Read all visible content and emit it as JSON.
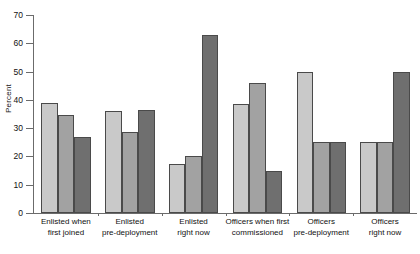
{
  "chart_data": {
    "type": "bar",
    "title": "",
    "subtitle": "",
    "xlabel": "",
    "ylabel": "Percent",
    "ylim": [
      0,
      70
    ],
    "ytick_values": [
      0,
      10,
      20,
      30,
      40,
      50,
      60,
      70
    ],
    "ytick_labels": [
      "0",
      "10",
      "20",
      "30",
      "40",
      "50",
      "60",
      "70"
    ],
    "grid": false,
    "legend": "none",
    "categories": [
      "Enlisted when\nfirst joined",
      "Enlisted\npre-deployment",
      "Enlisted\nright now",
      "Officers when first\ncommissioned",
      "Officers\npre-deployment",
      "Officers\nright now"
    ],
    "series": [
      {
        "name": "series-1",
        "color": "#c9c9c9",
        "values": [
          39,
          36,
          17.5,
          38.5,
          50,
          25
        ]
      },
      {
        "name": "series-2",
        "color": "#a2a2a2",
        "values": [
          34.5,
          28.5,
          20,
          46,
          25,
          25
        ]
      },
      {
        "name": "series-3",
        "color": "#6f6f6f",
        "values": [
          27,
          36.5,
          63,
          15,
          25,
          50
        ]
      }
    ]
  }
}
